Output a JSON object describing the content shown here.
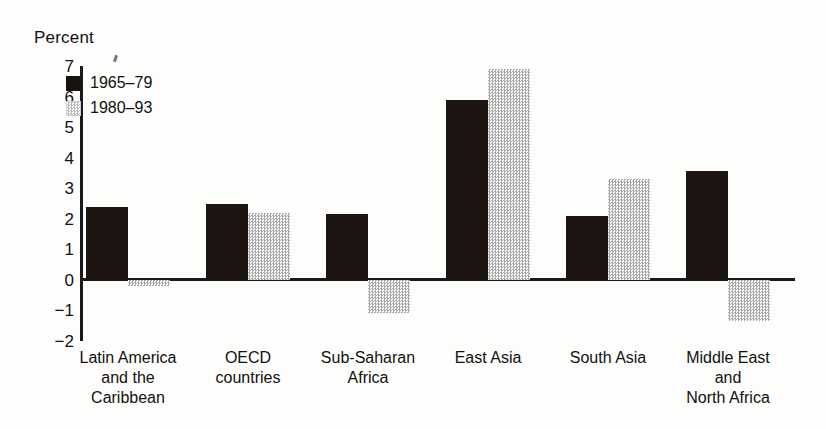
{
  "chart_data": {
    "type": "bar",
    "title": "Percent",
    "xlabel": "",
    "ylabel": "Percent",
    "ylim": [
      -2,
      7
    ],
    "yticks": [
      7,
      6,
      5,
      4,
      3,
      2,
      1,
      0,
      "−1",
      "−2"
    ],
    "grid": false,
    "legend_position": "top-left",
    "categories": [
      "Latin America\nand the\nCaribbean",
      "OECD\ncountries",
      "Sub-Saharan\nAfrica",
      "East Asia",
      "South Asia",
      "Middle East\nand\nNorth Africa"
    ],
    "series": [
      {
        "name": "1965–79",
        "color": "#1d1512",
        "values": [
          2.4,
          2.5,
          2.15,
          5.9,
          2.1,
          3.55
        ]
      },
      {
        "name": "1980–93",
        "color": "#a8a8a8",
        "values": [
          -0.2,
          2.2,
          -1.1,
          6.9,
          3.3,
          -1.35
        ]
      }
    ]
  },
  "legend": {
    "items": [
      {
        "label": "1965–79",
        "swatch": "dark"
      },
      {
        "label": "1980–93",
        "swatch": "light"
      }
    ]
  }
}
